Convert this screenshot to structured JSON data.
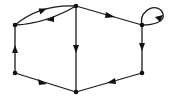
{
  "diagram": {
    "type": "directed-graph",
    "colors": {
      "background": "#ffffff",
      "stroke": "#1a1a1a",
      "node": "#111111"
    },
    "nodes": [
      {
        "id": "A",
        "position": "top-left",
        "x": 15,
        "y": 25
      },
      {
        "id": "B",
        "position": "top-middle",
        "x": 76,
        "y": 6
      },
      {
        "id": "C",
        "position": "top-right",
        "x": 142,
        "y": 25
      },
      {
        "id": "D",
        "position": "bottom-right",
        "x": 142,
        "y": 73
      },
      {
        "id": "E",
        "position": "bottom-middle",
        "x": 76,
        "y": 92
      },
      {
        "id": "F",
        "position": "bottom-left",
        "x": 15,
        "y": 73
      }
    ],
    "edges": [
      {
        "from": "A",
        "to": "B",
        "shape": "curve-upper"
      },
      {
        "from": "B",
        "to": "A",
        "shape": "curve-lower"
      },
      {
        "from": "B",
        "to": "C",
        "shape": "straight"
      },
      {
        "from": "C",
        "to": "C",
        "shape": "self-loop"
      },
      {
        "from": "C",
        "to": "D",
        "shape": "straight"
      },
      {
        "from": "B",
        "to": "E",
        "shape": "straight"
      },
      {
        "from": "D",
        "to": "E",
        "shape": "straight"
      },
      {
        "from": "E",
        "to": "F",
        "shape": "straight"
      },
      {
        "from": "F",
        "to": "A",
        "shape": "straight"
      }
    ]
  }
}
